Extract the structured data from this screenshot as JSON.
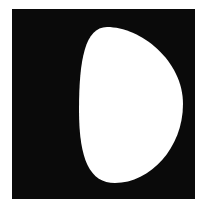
{
  "figure": {
    "background_color": "#ffffff",
    "square_color": "#0a0a0a",
    "shape_color": "#ffffff",
    "square": {
      "x": 12,
      "y": 9,
      "width": 183,
      "height": 190
    },
    "shape_path": "M 107 27 C 140 27, 183 60, 183 104 C 183 148, 150 183, 115 183 C 90 183, 79 160, 79 110 C 79 60, 85 27, 107 27 Z"
  }
}
